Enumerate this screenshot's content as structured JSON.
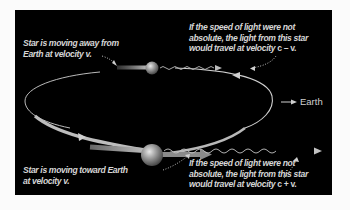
{
  "diagram": {
    "background_color": "#000000",
    "text_color": "#d6d6d6",
    "captions": {
      "receding_star": {
        "lines": [
          "Star is moving away from",
          "Earth at velocity v."
        ]
      },
      "receding_light": {
        "lines": [
          "If the speed of light were not",
          "absolute, the light from this star",
          "would travel at velocity "
        ],
        "formula": "c – v."
      },
      "approaching_star": {
        "lines": [
          "Star is moving toward  Earth",
          "at velocity v."
        ]
      },
      "approaching_light": {
        "lines": [
          "If the speed of light were not",
          "absolute, the light from this star",
          "would travel at velocity "
        ],
        "formula": "c + v."
      }
    },
    "earth_label": "Earth",
    "objects": [
      {
        "name": "receding-star",
        "size": "small",
        "direction": "away from Earth"
      },
      {
        "name": "approaching-star",
        "size": "large",
        "direction": "toward Earth"
      },
      {
        "name": "orbit",
        "shape": "ellipse"
      },
      {
        "name": "light-wave-receding",
        "style": "wavy arrow"
      },
      {
        "name": "light-wave-approaching",
        "style": "wavy arrow"
      }
    ]
  }
}
